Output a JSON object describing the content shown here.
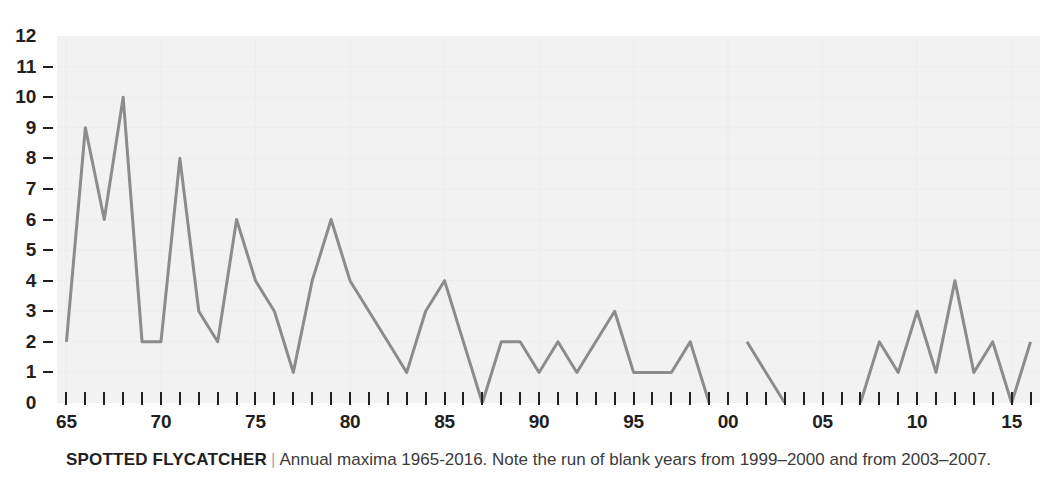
{
  "chart_data": {
    "type": "line",
    "title": "SPOTTED FLYCATCHER",
    "subtitle": "Annual maxima 1965-2016. Note the run of blank years from 1999–2000 and from 2003–2007.",
    "xlabel": "",
    "ylabel": "",
    "xlim": [
      1964.5,
      2016.5
    ],
    "ylim": [
      0,
      12
    ],
    "grid": true,
    "legend": null,
    "y_ticks": [
      0,
      1,
      2,
      3,
      4,
      5,
      6,
      7,
      8,
      9,
      10,
      11,
      12
    ],
    "y_tick_labels": [
      "0",
      "1",
      "2",
      "3",
      "4",
      "5",
      "6",
      "7",
      "8",
      "9",
      "10",
      "11",
      "12"
    ],
    "x_ticks": [
      1965,
      1966,
      1967,
      1968,
      1969,
      1970,
      1971,
      1972,
      1973,
      1974,
      1975,
      1976,
      1977,
      1978,
      1979,
      1980,
      1981,
      1982,
      1983,
      1984,
      1985,
      1986,
      1987,
      1988,
      1989,
      1990,
      1991,
      1992,
      1993,
      1994,
      1995,
      1996,
      1997,
      1998,
      1999,
      2000,
      2001,
      2002,
      2003,
      2004,
      2005,
      2006,
      2007,
      2008,
      2009,
      2010,
      2011,
      2012,
      2013,
      2014,
      2015,
      2016
    ],
    "x_major_ticks": [
      1965,
      1970,
      1975,
      1980,
      1985,
      1990,
      1995,
      2000,
      2005,
      2010,
      2015
    ],
    "x_major_tick_labels": [
      "65",
      "70",
      "75",
      "80",
      "85",
      "90",
      "95",
      "00",
      "05",
      "10",
      "15"
    ],
    "line_color": "#8c8c8c",
    "plot_background": "#f2f2f2",
    "x": [
      1965,
      1966,
      1967,
      1968,
      1969,
      1970,
      1971,
      1972,
      1973,
      1974,
      1975,
      1976,
      1977,
      1978,
      1979,
      1980,
      1981,
      1982,
      1983,
      1984,
      1985,
      1986,
      1987,
      1988,
      1989,
      1990,
      1991,
      1992,
      1993,
      1994,
      1995,
      1996,
      1997,
      1998,
      1999,
      2000,
      2001,
      2002,
      2003,
      2004,
      2005,
      2006,
      2007,
      2008,
      2009,
      2010,
      2011,
      2012,
      2013,
      2014,
      2015,
      2016
    ],
    "values": [
      2,
      9,
      6,
      10,
      2,
      2,
      8,
      3,
      2,
      6,
      4,
      3,
      1,
      4,
      6,
      4,
      3,
      2,
      1,
      3,
      4,
      2,
      0,
      2,
      2,
      1,
      2,
      1,
      2,
      3,
      1,
      1,
      1,
      2,
      0,
      null,
      2,
      1,
      0,
      null,
      null,
      null,
      0,
      2,
      1,
      3,
      1,
      4,
      1,
      2,
      0,
      2
    ],
    "segments": [
      {
        "start_year": 1965,
        "values": [
          2,
          9,
          6,
          10,
          2,
          2,
          8,
          3,
          2,
          6,
          4,
          3,
          1,
          4,
          6,
          4,
          3,
          2,
          1,
          3,
          4,
          2,
          0,
          2,
          2,
          1,
          2,
          1,
          2,
          3,
          1,
          1,
          1,
          2,
          0
        ]
      },
      {
        "start_year": 2001,
        "values": [
          2,
          1,
          0
        ]
      },
      {
        "start_year": 2007,
        "values": [
          0,
          2,
          1,
          3,
          1,
          4,
          1,
          2,
          0,
          2
        ]
      }
    ]
  },
  "caption": {
    "species": "SPOTTED FLYCATCHER",
    "separator": "|",
    "description": "Annual maxima 1965-2016. Note the run of blank years from 1999–2000 and from 2003–2007."
  }
}
